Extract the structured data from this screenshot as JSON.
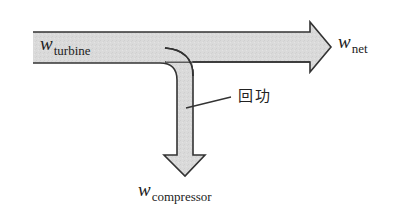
{
  "diagram": {
    "colors": {
      "fill": "#d9d9d9",
      "outline": "#333333",
      "text": "#222222",
      "background": "#ffffff"
    },
    "labels": {
      "turbine": {
        "symbol": "w",
        "subscript": "turbine"
      },
      "net": {
        "symbol": "w",
        "subscript": "net"
      },
      "compressor": {
        "symbol": "w",
        "subscript": "compressor"
      },
      "back_work": "回功"
    },
    "arrows": [
      {
        "name": "main-flow",
        "from": "turbine",
        "to": "net",
        "direction": "right"
      },
      {
        "name": "branch-flow",
        "from": "turbine",
        "to": "compressor",
        "direction": "down"
      }
    ]
  }
}
